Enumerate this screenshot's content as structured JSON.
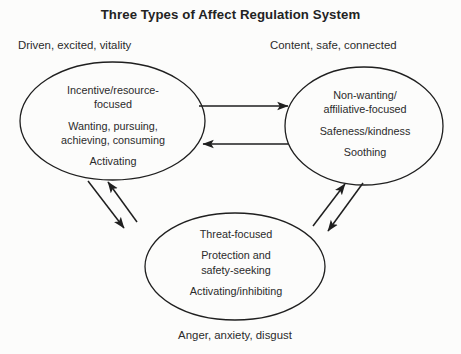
{
  "figure": {
    "title": "Three Types of Affect Regulation System",
    "background_color": "#fcfcfb",
    "stroke_color": "#1f1f1f",
    "text_color": "#2b2b2b"
  },
  "systems": {
    "drive": {
      "caption": "Driven, excited, vitality",
      "lines": [
        "Incentive/resource-\nfocused",
        "Wanting, pursuing,\nachieving, consuming",
        "Activating"
      ]
    },
    "soothing": {
      "caption": "Content, safe, connected",
      "lines": [
        "Non-wanting/\naffiliative-focused",
        "Safeness/kindness",
        "Soothing"
      ]
    },
    "threat": {
      "caption": "Anger, anxiety, disgust",
      "lines": [
        "Threat-focused",
        "Protection and\nsafety-seeking",
        "Activating/inhibiting"
      ]
    }
  },
  "connections": [
    {
      "name": "drive-to-soothing",
      "direction": "right"
    },
    {
      "name": "soothing-to-drive",
      "direction": "left"
    },
    {
      "name": "threat-to-drive",
      "direction": "up-left"
    },
    {
      "name": "drive-to-threat",
      "direction": "down-right"
    },
    {
      "name": "threat-to-soothing",
      "direction": "up-right"
    },
    {
      "name": "soothing-to-threat",
      "direction": "down-left"
    }
  ]
}
